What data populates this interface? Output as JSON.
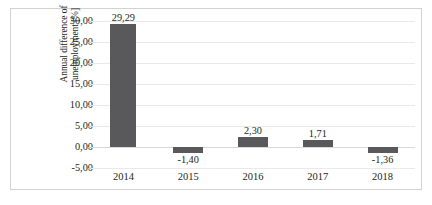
{
  "chart_data": {
    "type": "bar",
    "title": "",
    "xlabel": "",
    "ylabel": "Annual difference of unemployment [%]",
    "ylabel_lines": [
      "Annual difference of",
      "unemployment [%]"
    ],
    "categories": [
      "2014",
      "2015",
      "2016",
      "2017",
      "2018"
    ],
    "values": [
      29.29,
      -1.4,
      2.3,
      1.71,
      -1.36
    ],
    "data_labels": [
      "29,29",
      "-1,40",
      "2,30",
      "1,71",
      "-1,36"
    ],
    "ylim": [
      -5,
      30
    ],
    "ytick_values": [
      -5,
      0,
      5,
      10,
      15,
      20,
      25,
      30
    ],
    "ytick_labels": [
      "-5,00",
      "0,00",
      "5,00",
      "10,00",
      "15,00",
      "20,00",
      "25,00",
      "30,00"
    ],
    "grid": true,
    "legend": "none",
    "decimal_separator": ",",
    "bar_color": "#59595b",
    "gridline_color": "#e9e9e9",
    "background_color": "#ffffff",
    "border_color": "#d2d2d2",
    "text_color": "#231f20"
  }
}
